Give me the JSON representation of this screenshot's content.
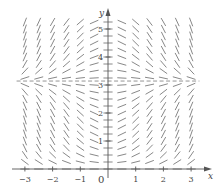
{
  "diagram": {
    "type": "slope_field",
    "equation_inferred": "dy/dx = x sin(y)",
    "x_axis": {
      "label": "x",
      "range": [
        -3,
        3
      ],
      "ticks": [
        -3,
        -2,
        -1,
        1,
        2,
        3
      ],
      "tick_labels": [
        "−3",
        "−2",
        "−1",
        "1",
        "2",
        "3"
      ]
    },
    "y_axis": {
      "label": "y",
      "range": [
        0,
        5.2
      ],
      "ticks": [
        1,
        2,
        3,
        4,
        5
      ],
      "tick_labels": [
        "1",
        "2",
        "3",
        "4",
        "5"
      ]
    },
    "origin_label": "0",
    "grid": {
      "x_step": 0.5,
      "y_step": 0.25,
      "x_min": -3,
      "x_max": 3,
      "y_min": 0,
      "y_max": 5.25
    },
    "pixel_mapping": {
      "origin_px": [
        108,
        169
      ],
      "x_unit_px": 27.7,
      "y_unit_px": 28
    },
    "equilibrium_line": {
      "y": 3.14159,
      "style": "dashed"
    },
    "colors": {
      "segment": "#7a7a7a",
      "axis": "#555555",
      "text": "#444444"
    }
  }
}
